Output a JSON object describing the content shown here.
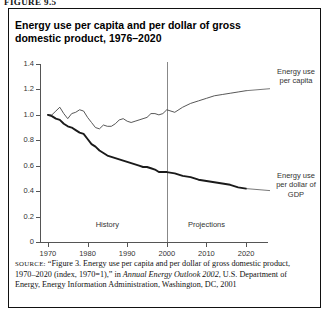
{
  "figure": {
    "label": "FIGURE 9.5",
    "title": "Energy use per capita and per dollar of gross domestic product, 1976–2020"
  },
  "source": {
    "kicker": "SOURCE:",
    "part1": " “Figure 3. Energy use per capita and per dollar of gross domestic product, 1970–2020 (index, 1970=1),” in ",
    "italic": "Annual Energy Outlook 2002",
    "part2": ", U.S. Department of Energy, Energy Information Administration, Washington, DC, 2001"
  },
  "annotations": {
    "history": "History",
    "projections": "Projections",
    "series_capita": "Energy use per capita",
    "series_gdp": "Energy use per dollar of GDP"
  },
  "chart_data": {
    "type": "line",
    "title": "Energy use per capita and per dollar of gross domestic product, 1976–2020",
    "xlabel": "",
    "ylabel": "",
    "index_note": "index, 1970=1",
    "xlim": [
      1968,
      2022
    ],
    "ylim": [
      0,
      1.4
    ],
    "xticks": [
      1970,
      1980,
      1990,
      2000,
      2010,
      2020
    ],
    "yticks": [
      0,
      0.2,
      0.4,
      0.6,
      0.8,
      1.0,
      1.2,
      1.4
    ],
    "grid": false,
    "legend_position": "right-inline",
    "divider_year": 2000,
    "history_range": [
      1970,
      2000
    ],
    "projection_range": [
      2000,
      2020
    ],
    "x": [
      1970,
      1971,
      1972,
      1973,
      1974,
      1975,
      1976,
      1977,
      1978,
      1979,
      1980,
      1981,
      1982,
      1983,
      1984,
      1985,
      1986,
      1987,
      1988,
      1989,
      1990,
      1991,
      1992,
      1993,
      1994,
      1995,
      1996,
      1997,
      1998,
      1999,
      2000,
      2002,
      2004,
      2006,
      2008,
      2010,
      2012,
      2014,
      2016,
      2018,
      2020
    ],
    "series": [
      {
        "name": "Energy use per capita",
        "values": [
          1.0,
          1.0,
          1.03,
          1.06,
          1.01,
          0.97,
          1.01,
          1.02,
          1.04,
          1.03,
          0.98,
          0.94,
          0.9,
          0.89,
          0.92,
          0.91,
          0.91,
          0.93,
          0.96,
          0.97,
          0.95,
          0.94,
          0.95,
          0.96,
          0.97,
          0.98,
          1.01,
          1.01,
          1.0,
          1.01,
          1.04,
          1.02,
          1.06,
          1.09,
          1.11,
          1.13,
          1.15,
          1.16,
          1.17,
          1.18,
          1.19
        ]
      },
      {
        "name": "Energy use per dollar of GDP",
        "values": [
          1.0,
          0.99,
          0.97,
          0.96,
          0.93,
          0.91,
          0.9,
          0.88,
          0.86,
          0.85,
          0.81,
          0.77,
          0.75,
          0.72,
          0.7,
          0.68,
          0.67,
          0.66,
          0.65,
          0.64,
          0.63,
          0.62,
          0.61,
          0.6,
          0.59,
          0.59,
          0.58,
          0.57,
          0.55,
          0.55,
          0.55,
          0.54,
          0.52,
          0.51,
          0.49,
          0.48,
          0.47,
          0.46,
          0.45,
          0.43,
          0.42
        ]
      }
    ]
  }
}
